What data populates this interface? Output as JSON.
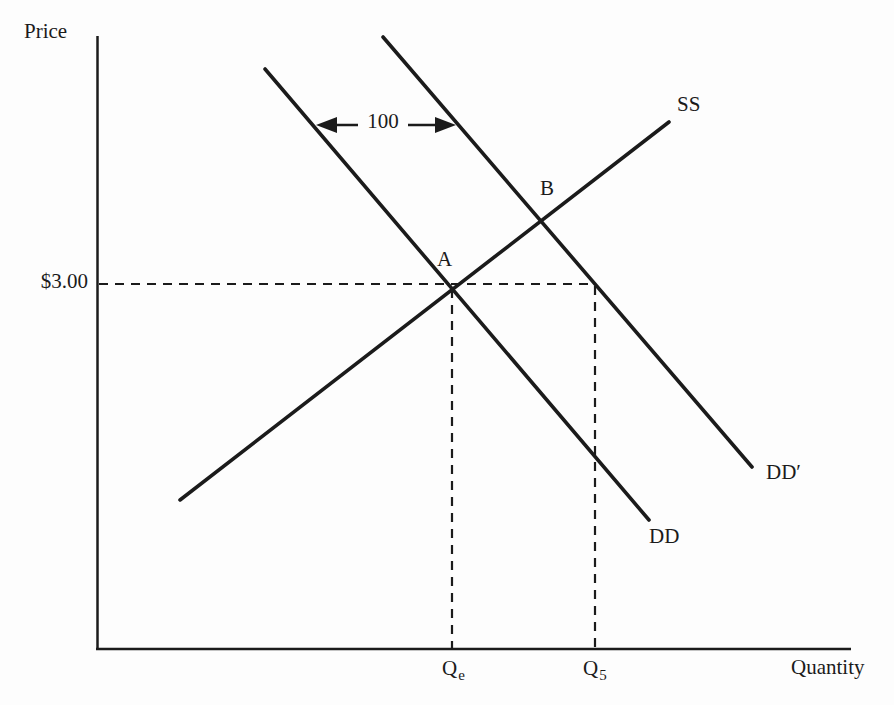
{
  "figure": {
    "background": "#fdfdfd",
    "ink": "#1b1b1b"
  },
  "labels": {
    "y_axis": "Price",
    "x_axis": "Quantity",
    "price_value": "$3.00",
    "point_a": "A",
    "point_b": "B",
    "supply": "SS",
    "demand": "DD",
    "demand_shifted": "DD′",
    "shift_amount": "100",
    "qe_base": "Q",
    "qe_sub": "e",
    "q5_base": "Q",
    "q5_sub": "5"
  },
  "chart_data": {
    "type": "line",
    "xlabel": "Quantity",
    "ylabel": "Price",
    "series": [
      {
        "name": "SS",
        "role": "supply curve",
        "direction": "upward-sloping"
      },
      {
        "name": "DD",
        "role": "original demand curve",
        "direction": "downward-sloping"
      },
      {
        "name": "DD′",
        "role": "demand curve shifted right of DD",
        "direction": "downward-sloping"
      }
    ],
    "points": [
      {
        "name": "A",
        "at": "intersection of SS and DD",
        "price": "$3.00",
        "quantity": "Qe"
      },
      {
        "name": "B",
        "at": "intersection of SS and DD′"
      }
    ],
    "annotations": [
      {
        "label": "100",
        "type": "double-headed horizontal arrow between DD and DD′"
      },
      {
        "label": "$3.00",
        "type": "dashed horizontal guide from price axis through A to DD′"
      },
      {
        "label": "Qe",
        "type": "dashed vertical guide from A to quantity axis"
      },
      {
        "label": "Q5",
        "type": "dashed vertical guide from DD′ at $3.00 to quantity axis"
      }
    ],
    "grid": false,
    "legend": false
  },
  "geometry": {
    "width": 894,
    "height": 705,
    "lines": [
      {
        "name": "y-axis",
        "x1": 97.5,
        "y1": 36,
        "x2": 97.5,
        "y2": 650,
        "w": 2.5
      },
      {
        "name": "x-axis",
        "x1": 96,
        "y1": 649,
        "x2": 851,
        "y2": 649,
        "w": 2.5
      },
      {
        "name": "supply-curve-ss",
        "x1": 180,
        "y1": 500,
        "x2": 669,
        "y2": 122,
        "w": 3.6,
        "cap": "round"
      },
      {
        "name": "demand-curve-dd",
        "x1": 265,
        "y1": 69,
        "x2": 649,
        "y2": 520,
        "w": 3.6,
        "cap": "round"
      },
      {
        "name": "demand-curve-dd-prime",
        "x1": 383,
        "y1": 37,
        "x2": 752,
        "y2": 467,
        "w": 3.6,
        "cap": "round"
      },
      {
        "name": "price-dashed-guide",
        "x1": 99,
        "y1": 284,
        "x2": 595,
        "y2": 284,
        "w": 2.2,
        "dash": "9 7"
      },
      {
        "name": "qe-dashed-guide",
        "x1": 452,
        "y1": 289,
        "x2": 452,
        "y2": 648,
        "w": 2.2,
        "dash": "9 7"
      },
      {
        "name": "q5-dashed-guide",
        "x1": 595,
        "y1": 286,
        "x2": 595,
        "y2": 648,
        "w": 2.2,
        "dash": "9 7"
      },
      {
        "name": "shift-arrow-shaft",
        "x1": 332,
        "y1": 125,
        "x2": 440,
        "y2": 125,
        "w": 2.4
      }
    ],
    "arrowheads": [
      {
        "name": "shift-arrow-left-head",
        "points": "316,125 337,117 337,133"
      },
      {
        "name": "shift-arrow-right-head",
        "points": "456,125 435,117 435,133"
      }
    ]
  }
}
